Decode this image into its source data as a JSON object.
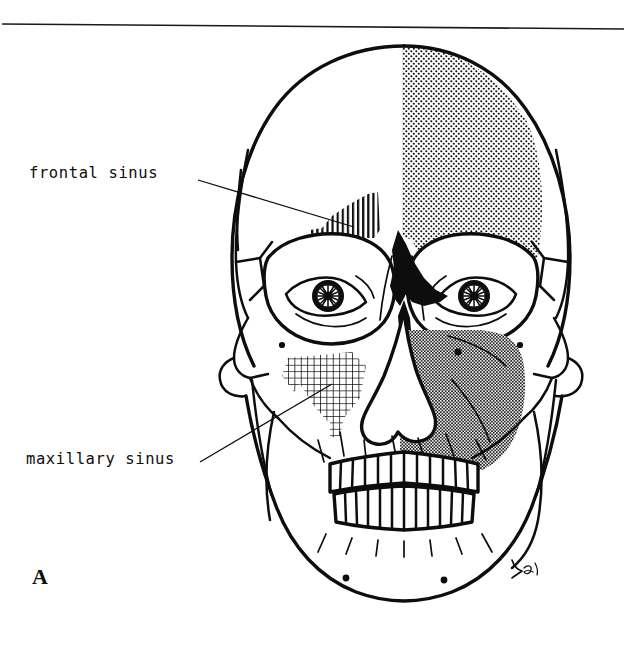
{
  "figure": {
    "panel_letter": "A",
    "view": "anterior-skull",
    "top_rule": true
  },
  "labels": [
    {
      "id": "frontal-sinus",
      "text": "frontal sinus",
      "leader_from": [
        198,
        180
      ],
      "leader_to": [
        352,
        226
      ],
      "points_to": "frontal-sinus-region"
    },
    {
      "id": "maxillary-sinus",
      "text": "maxillary sinus",
      "leader_from": [
        200,
        462
      ],
      "leader_to": [
        330,
        386
      ],
      "points_to": "maxillary-sinus-region"
    }
  ],
  "regions": [
    {
      "id": "frontal-sinus-region",
      "name": "frontal sinus",
      "fill_pattern": "vertical-line-hatch",
      "side": "left"
    },
    {
      "id": "maxillary-sinus-region",
      "name": "maxillary sinus",
      "fill_pattern": "cross-hatch-grid",
      "side": "left"
    },
    {
      "id": "frontal-bone-shade",
      "name": "frontal bone",
      "fill_pattern": "light-stipple",
      "side": "right"
    },
    {
      "id": "maxilla-shade",
      "name": "maxilla",
      "fill_pattern": "dense-stipple",
      "side": "right"
    },
    {
      "id": "ethmoid-region",
      "name": "ethmoid / nasal root",
      "fill_pattern": "solid-black",
      "side": "center"
    }
  ],
  "colors": {
    "ink": "#0d0d0d",
    "paper": "#ffffff",
    "light_shade": "#b9b9b9",
    "dense_shade": "#8a8a8a"
  },
  "signature": {
    "present": true,
    "monogram": "Ed"
  }
}
